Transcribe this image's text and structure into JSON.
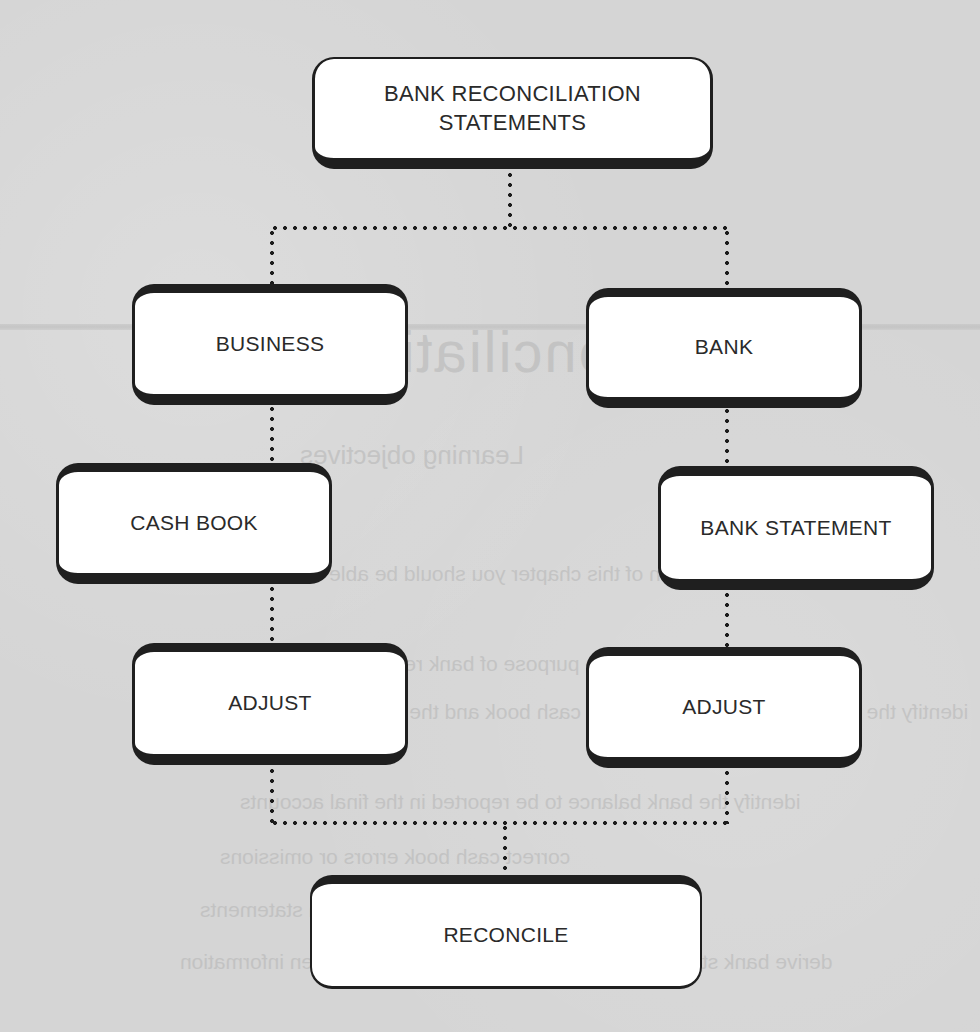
{
  "diagram": {
    "nodes": {
      "root": "BANK RECONCILIATION\nSTATEMENTS",
      "root_line1": "BANK RECONCILIATION",
      "root_line2": "STATEMENTS",
      "business": "BUSINESS",
      "bank": "BANK",
      "cash_book": "CASH BOOK",
      "bank_statement": "BANK STATEMENT",
      "adjust_left": "ADJUST",
      "adjust_right": "ADJUST",
      "reconcile": "RECONCILE"
    },
    "edges": [
      {
        "from": "root",
        "to": "business",
        "style": "dotted"
      },
      {
        "from": "root",
        "to": "bank",
        "style": "dotted"
      },
      {
        "from": "business",
        "to": "cash_book",
        "style": "dotted"
      },
      {
        "from": "bank",
        "to": "bank_statement",
        "style": "dotted"
      },
      {
        "from": "cash_book",
        "to": "adjust_left",
        "style": "dotted"
      },
      {
        "from": "bank_statement",
        "to": "adjust_right",
        "style": "dotted"
      },
      {
        "from": "adjust_left",
        "to": "reconcile",
        "style": "dotted"
      },
      {
        "from": "adjust_right",
        "to": "reconcile",
        "style": "dotted"
      }
    ],
    "colors": {
      "background": "#d6d6d6",
      "box_fill": "#ffffff",
      "box_border": "#1f1f1f",
      "text": "#2a2a2a",
      "connector": "#1c1c1c"
    }
  },
  "bleed_through": {
    "heading": "reconciliations",
    "subheading": "Learning objectives",
    "intro": "Upon completion of this chapter you should be able to:",
    "bullets": [
      "describe the purpose of bank reconciliations",
      "identify the main differences between the cash book and the bank statement",
      "identify the bank balance to be reported in the final accounts",
      "correct cash book errors or omissions",
      "prepare bank reconciliation statements",
      "derive bank statement and cash book balances from given information"
    ]
  }
}
